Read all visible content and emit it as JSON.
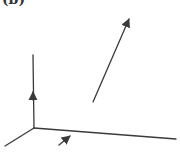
{
  "figure": {
    "label": "(b)",
    "stroke_color": "#3a3a3a",
    "axes": {
      "origin": [
        34,
        128
      ],
      "vertical": {
        "from": [
          34,
          128
        ],
        "to": [
          33,
          55
        ]
      },
      "horizontal": {
        "from": [
          34,
          128
        ],
        "to": [
          176,
          139
        ]
      },
      "diagonal": {
        "from": [
          34,
          128
        ],
        "to": [
          5,
          146
        ]
      }
    },
    "vectors": [
      {
        "name": "vertical-axis-arrow",
        "from": [
          33,
          100
        ],
        "to": [
          33,
          91
        ]
      },
      {
        "name": "small-vector",
        "from": [
          59,
          145
        ],
        "to": [
          70,
          136
        ]
      },
      {
        "name": "large-vector",
        "from": [
          93,
          102
        ],
        "to": [
          129,
          19
        ]
      }
    ]
  }
}
